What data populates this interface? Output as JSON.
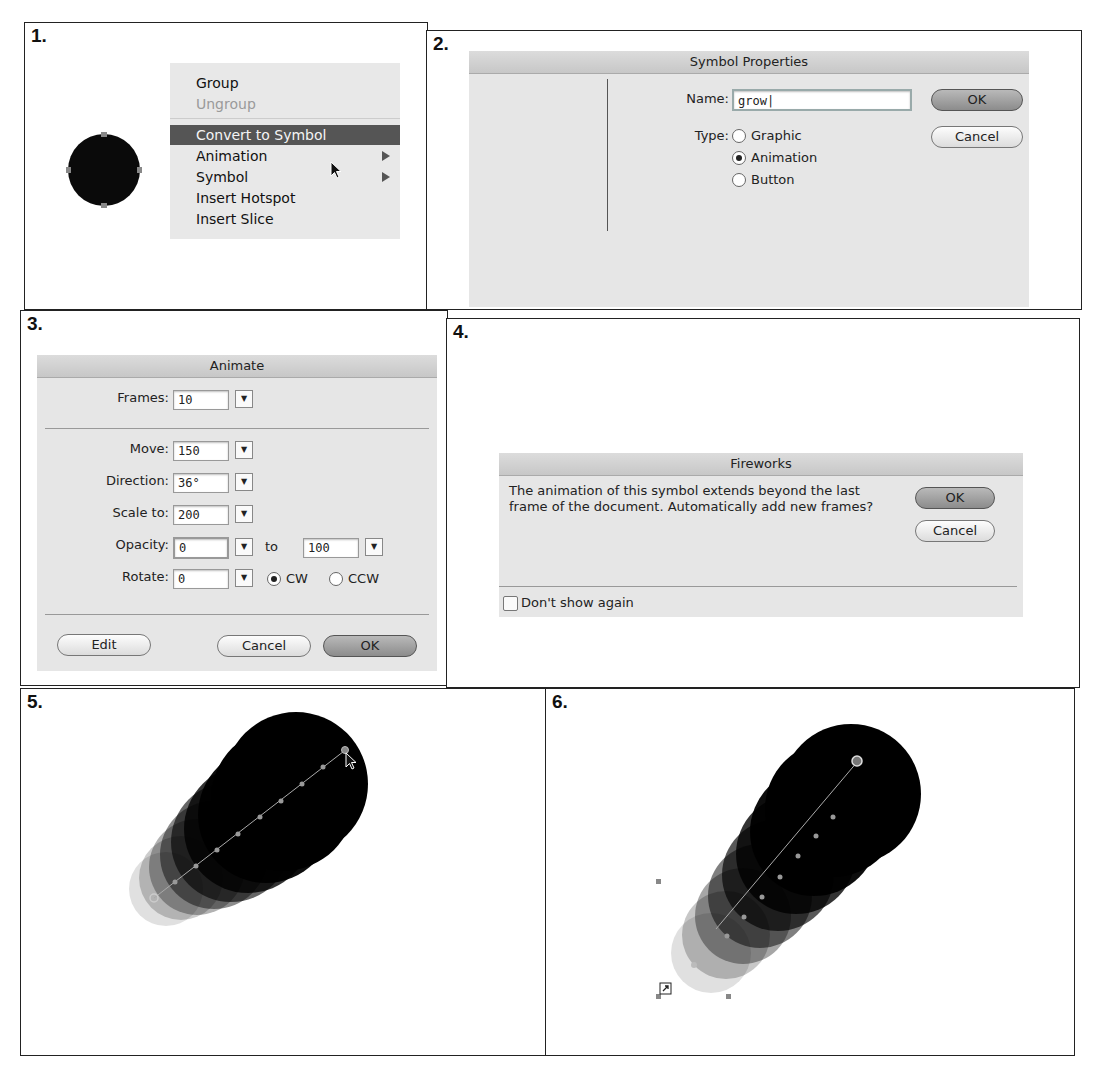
{
  "steps": [
    {
      "number": "1."
    },
    {
      "number": "2."
    },
    {
      "number": "3."
    },
    {
      "number": "4."
    },
    {
      "number": "5."
    },
    {
      "number": "6."
    }
  ],
  "context_menu": {
    "items": [
      {
        "label": "Group",
        "state": "enabled"
      },
      {
        "label": "Ungroup",
        "state": "disabled"
      },
      {
        "label": "Convert to Symbol",
        "state": "highlighted"
      },
      {
        "label": "Animation",
        "submenu": true
      },
      {
        "label": "Symbol",
        "submenu": true
      },
      {
        "label": "Insert Hotspot"
      },
      {
        "label": "Insert Slice"
      }
    ]
  },
  "symbol_properties": {
    "title": "Symbol Properties",
    "name_label": "Name:",
    "name_value": "grow",
    "type_label": "Type:",
    "types": [
      {
        "label": "Graphic",
        "selected": false
      },
      {
        "label": "Animation",
        "selected": true
      },
      {
        "label": "Button",
        "selected": false
      }
    ],
    "ok_label": "OK",
    "cancel_label": "Cancel"
  },
  "animate": {
    "title": "Animate",
    "frames_label": "Frames:",
    "frames_value": "10",
    "move_label": "Move:",
    "move_value": "150",
    "direction_label": "Direction:",
    "direction_value": "36°",
    "scale_label": "Scale to:",
    "scale_value": "200",
    "opacity_label": "Opacity:",
    "opacity_from": "0",
    "opacity_to_label": "to",
    "opacity_to": "100",
    "rotate_label": "Rotate:",
    "rotate_value": "0",
    "cw_label": "CW",
    "ccw_label": "CCW",
    "cw_selected": true,
    "edit_label": "Edit",
    "cancel_label": "Cancel",
    "ok_label": "OK"
  },
  "fireworks_alert": {
    "title": "Fireworks",
    "message": "The animation of this symbol extends beyond the last frame of the document. Automatically add new frames?",
    "ok_label": "OK",
    "cancel_label": "Cancel",
    "dont_show_label": "Don't show again",
    "dont_show_checked": false
  }
}
